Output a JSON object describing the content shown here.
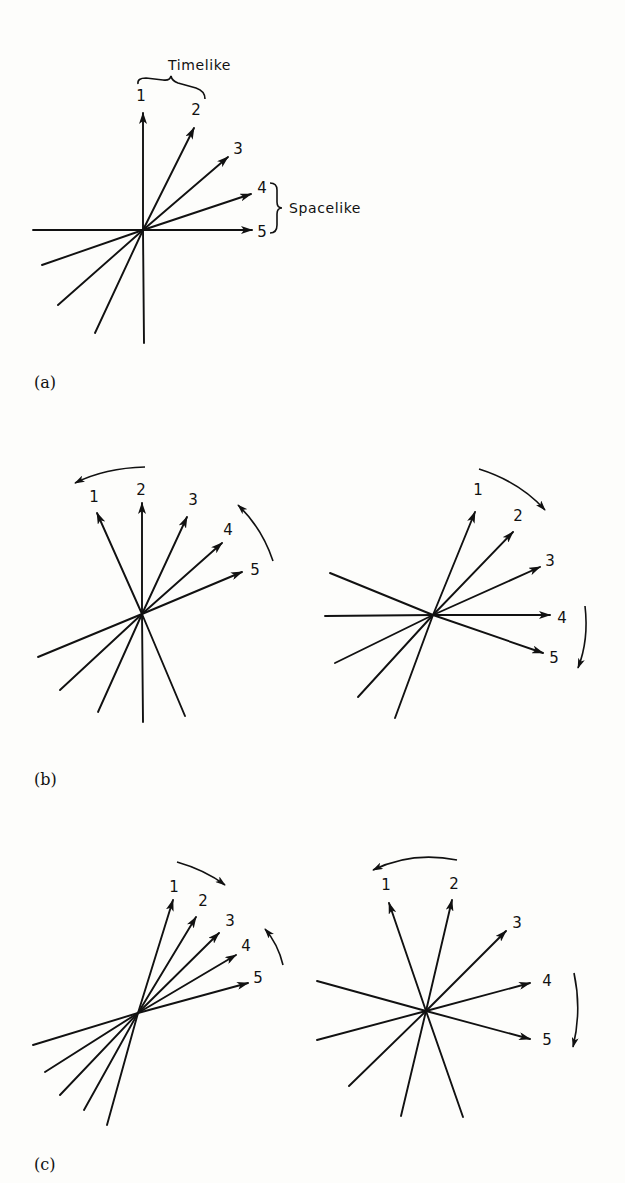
{
  "figure": {
    "panel_labels": [
      "(a)",
      "(b)",
      "(c)"
    ],
    "annotations": {
      "timelike": "Timelike",
      "spacelike": "Spacelike"
    },
    "vector_labels": [
      "1",
      "2",
      "3",
      "4",
      "5"
    ],
    "panels": [
      {
        "id": "a",
        "center": [
          143,
          230
        ],
        "tips": [
          [
            143,
            113
          ],
          [
            194,
            128
          ],
          [
            228,
            157
          ],
          [
            251,
            194
          ],
          [
            252,
            230
          ]
        ],
        "tails": [
          [
            33,
            230
          ],
          [
            144,
            343
          ],
          [
            42,
            265
          ],
          [
            58,
            305
          ],
          [
            95,
            333
          ]
        ],
        "label_pos": [
          [
            141,
            101
          ],
          [
            196,
            115
          ],
          [
            238,
            154
          ],
          [
            262,
            193
          ],
          [
            262,
            237
          ]
        ]
      },
      {
        "id": "b-left",
        "center": [
          142,
          614
        ],
        "tips": [
          [
            97,
            513
          ],
          [
            142,
            503
          ],
          [
            187,
            517
          ],
          [
            222,
            543
          ],
          [
            242,
            572
          ]
        ],
        "tails": [
          [
            38,
            657
          ],
          [
            60,
            690
          ],
          [
            98,
            712
          ],
          [
            143,
            722
          ],
          [
            185,
            716
          ]
        ],
        "label_pos": [
          [
            94,
            502
          ],
          [
            141,
            495
          ],
          [
            193,
            505
          ],
          [
            228,
            535
          ],
          [
            255,
            575
          ]
        ],
        "arcs": [
          {
            "d": "M145,467 Q105,468 75,483",
            "head": [
              75,
              483
            ],
            "dir": [
              -1,
              0.45
            ]
          },
          {
            "d": "M273,561 Q262,528 238,505",
            "head": [
              238,
              505
            ],
            "dir": [
              -0.7,
              -0.7
            ]
          }
        ]
      },
      {
        "id": "b-right",
        "center": [
          433,
          615
        ],
        "tips": [
          [
            475,
            512
          ],
          [
            513,
            532
          ],
          [
            540,
            567
          ],
          [
            550,
            615
          ],
          [
            543,
            653
          ]
        ],
        "tails": [
          [
            330,
            573
          ],
          [
            325,
            616
          ],
          [
            335,
            663
          ],
          [
            358,
            697
          ],
          [
            395,
            718
          ]
        ],
        "label_pos": [
          [
            478,
            495
          ],
          [
            518,
            521
          ],
          [
            550,
            566
          ],
          [
            562,
            623
          ],
          [
            554,
            663
          ]
        ],
        "arcs": [
          {
            "d": "M479,469 Q520,482 545,510",
            "head": [
              545,
              510
            ],
            "dir": [
              0.7,
              0.75
            ]
          },
          {
            "d": "M585,606 Q589,640 578,668",
            "head": [
              578,
              668
            ],
            "dir": [
              -0.3,
              1
            ]
          }
        ]
      },
      {
        "id": "c-left",
        "center": [
          138,
          1013
        ],
        "tips": [
          [
            173,
            900
          ],
          [
            196,
            917
          ],
          [
            219,
            933
          ],
          [
            236,
            955
          ],
          [
            248,
            983
          ]
        ],
        "tails": [
          [
            33,
            1045
          ],
          [
            45,
            1072
          ],
          [
            60,
            1095
          ],
          [
            84,
            1110
          ],
          [
            107,
            1125
          ]
        ],
        "label_pos": [
          [
            174,
            892
          ],
          [
            203,
            906
          ],
          [
            230,
            926
          ],
          [
            246,
            951
          ],
          [
            258,
            983
          ]
        ],
        "arcs": [
          {
            "d": "M177,862 Q205,870 225,885",
            "head": [
              225,
              885
            ],
            "dir": [
              0.8,
              0.6
            ]
          },
          {
            "d": "M283,965 Q278,944 265,929",
            "head": [
              265,
              929
            ],
            "dir": [
              -0.65,
              -0.76
            ]
          }
        ]
      },
      {
        "id": "c-right",
        "center": [
          426,
          1011
        ],
        "tips": [
          [
            389,
            903
          ],
          [
            452,
            900
          ],
          [
            506,
            931
          ],
          [
            530,
            983
          ],
          [
            530,
            1039
          ]
        ],
        "tails": [
          [
            317,
            981
          ],
          [
            317,
            1040
          ],
          [
            349,
            1086
          ],
          [
            401,
            1116
          ],
          [
            463,
            1117
          ]
        ],
        "label_pos": [
          [
            386,
            890
          ],
          [
            454,
            889
          ],
          [
            517,
            928
          ],
          [
            547,
            986
          ],
          [
            547,
            1045
          ]
        ],
        "arcs": [
          {
            "d": "M457,860 Q412,851 373,870",
            "head": [
              373,
              870
            ],
            "dir": [
              -1,
              0.45
            ]
          },
          {
            "d": "M574,973 Q582,1010 573,1047",
            "head": [
              573,
              1047
            ],
            "dir": [
              -0.2,
              1
            ]
          }
        ]
      }
    ]
  }
}
